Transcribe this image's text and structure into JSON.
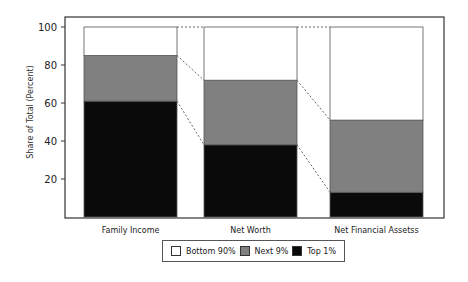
{
  "chart_data": {
    "type": "bar",
    "stacked": true,
    "title": "",
    "xlabel": "",
    "ylabel": "Share of Total (Percent)",
    "ylim": [
      0,
      100
    ],
    "yticks": [
      20,
      40,
      60,
      80,
      100
    ],
    "grid": false,
    "legend_position": "bottom",
    "categories": [
      "Family Income",
      "Net Worth",
      "Net Financial Assetss"
    ],
    "series": [
      {
        "name": "Top 1%",
        "color": "#0a0a0a",
        "values": [
          61,
          38,
          13
        ]
      },
      {
        "name": "Next 9%",
        "color": "#808080",
        "values": [
          24,
          34,
          38
        ]
      },
      {
        "name": "Bottom 90%",
        "color": "#ffffff",
        "values": [
          15,
          28,
          49
        ]
      }
    ],
    "connectors": "dashed lines linking segment boundaries between adjacent bars"
  },
  "legend": {
    "items": [
      {
        "label": "Bottom 90%",
        "color": "#ffffff"
      },
      {
        "label": "Next 9%",
        "color": "#808080"
      },
      {
        "label": "Top 1%",
        "color": "#0a0a0a"
      }
    ]
  }
}
